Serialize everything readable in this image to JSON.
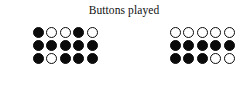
{
  "figure": {
    "title": "Buttons played",
    "width": 248,
    "height": 105,
    "background_color": "#ffffff",
    "marker_color_filled": "#0b0b0b",
    "marker_color_open": "#ffffff",
    "marker_stroke_color": "#0b0b0b"
  },
  "chart_data": {
    "type": "table",
    "title": "Buttons played",
    "subtitle": "",
    "xlabel": "",
    "ylabel": "",
    "grid": false,
    "legend": [],
    "marker_states": [
      "filled",
      "open"
    ],
    "columns": 5,
    "rows": 3,
    "groups": [
      {
        "name": "left-group",
        "label": "",
        "rows": [
          [
            "filled",
            "open",
            "open",
            "filled",
            "open"
          ],
          [
            "filled",
            "filled",
            "filled",
            "filled",
            "filled"
          ],
          [
            "filled",
            "open",
            "filled",
            "filled",
            "filled"
          ]
        ],
        "filled_counts_by_row": [
          2,
          5,
          4
        ],
        "total_filled": 11,
        "total_open": 4,
        "total_markers": 15
      },
      {
        "name": "right-group",
        "label": "",
        "rows": [
          [
            "open",
            "open",
            "open",
            "open",
            "open"
          ],
          [
            "filled",
            "filled",
            "filled",
            "filled",
            "filled"
          ],
          [
            "filled",
            "filled",
            "filled",
            "open",
            "open"
          ]
        ],
        "filled_counts_by_row": [
          0,
          5,
          3
        ],
        "total_filled": 8,
        "total_open": 7,
        "total_markers": 15
      }
    ]
  }
}
